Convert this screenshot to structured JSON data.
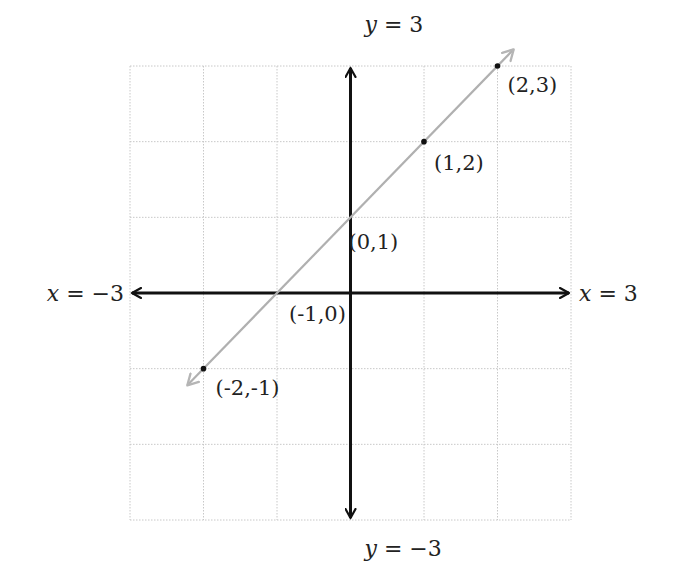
{
  "chart_data": {
    "type": "line",
    "title": "",
    "xlabel": "",
    "ylabel": "",
    "xlim": [
      -3,
      3
    ],
    "ylim": [
      -3,
      3
    ],
    "grid": true,
    "axis_labels": {
      "x_left": "x = −3",
      "x_right": "x = 3",
      "y_top": "y = 3",
      "y_bottom": "y = −3"
    },
    "series": [
      {
        "name": "y = x + 1",
        "color": "#b0b0b0",
        "points": [
          {
            "x": -2,
            "y": -1,
            "label": "(-2,-1)"
          },
          {
            "x": -1,
            "y": 0,
            "label": "(-1,0)"
          },
          {
            "x": 0,
            "y": 1,
            "label": "(0,1)"
          },
          {
            "x": 1,
            "y": 2,
            "label": "(1,2)"
          },
          {
            "x": 2,
            "y": 3,
            "label": "(2,3)"
          }
        ]
      }
    ]
  },
  "colors": {
    "axis": "#111111",
    "grid": "#c8c8c8",
    "line": "#b0b0b0",
    "point": "#111111"
  }
}
